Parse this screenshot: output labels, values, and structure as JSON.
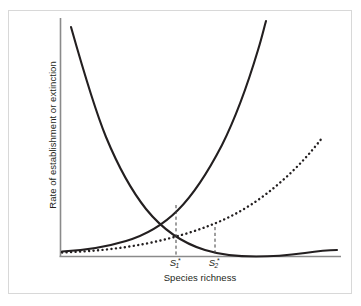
{
  "figure": {
    "background_color": "#ffffff",
    "frame_color": "#d8d8d8",
    "ink_color": "#231f20",
    "axis_color": "#8a8a8a"
  },
  "axes": {
    "y_title": "Rate of establishment or extinction",
    "x_title": "Species richness"
  },
  "ticks": [
    {
      "symbol": "S",
      "sub": "1",
      "sup": "*",
      "x_px": 176
    },
    {
      "symbol": "S",
      "sub": "2",
      "sup": "*",
      "x_px": 215
    }
  ],
  "chart_data": {
    "type": "line",
    "title": "",
    "subtitle": "",
    "xlabel": "Species richness",
    "ylabel": "Rate of establishment or extinction",
    "xlim": [
      0,
      1
    ],
    "ylim": [
      0,
      1
    ],
    "grid": false,
    "legend": "none",
    "x_tick_labels": [
      "S₁*",
      "S₂*"
    ],
    "y_tick_labels": [],
    "annotations": [
      {
        "name": "equilibrium-1",
        "label": "S₁*",
        "description": "Intersection of the decreasing extinction-like curve with the steep increasing establishment curve",
        "x": 0.414,
        "y": 0.218
      },
      {
        "name": "equilibrium-2",
        "label": "S₂*",
        "description": "Intersection of the decreasing extinction-like curve with the shallow dotted establishment curve",
        "x": 0.554,
        "y": 0.126
      }
    ],
    "series": [
      {
        "name": "Rate of extinction (decreasing)",
        "style": "solid",
        "color": "#231f20",
        "width": 2.0,
        "x": [
          0.04,
          0.08,
          0.12,
          0.16,
          0.2,
          0.24,
          0.28,
          0.32,
          0.36,
          0.4,
          0.44,
          0.48,
          0.52,
          0.56,
          0.6,
          0.65,
          0.7,
          0.75,
          0.8,
          0.85,
          0.9,
          0.95,
          1.0
        ],
        "y": [
          0.96,
          0.82,
          0.705,
          0.61,
          0.53,
          0.462,
          0.404,
          0.354,
          0.311,
          0.274,
          0.242,
          0.214,
          0.19,
          0.169,
          0.15,
          0.129,
          0.112,
          0.097,
          0.085,
          0.074,
          0.065,
          0.057,
          0.05
        ]
      },
      {
        "name": "Rate of establishment, high immigration (increasing)",
        "style": "solid",
        "color": "#231f20",
        "width": 2.0,
        "x": [
          0.0,
          0.05,
          0.1,
          0.15,
          0.2,
          0.25,
          0.3,
          0.35,
          0.4,
          0.45,
          0.5,
          0.55,
          0.6,
          0.65,
          0.7,
          0.73
        ],
        "y": [
          0.018,
          0.024,
          0.033,
          0.045,
          0.062,
          0.085,
          0.116,
          0.159,
          0.208,
          0.272,
          0.355,
          0.463,
          0.59,
          0.74,
          0.92,
          1.0
        ]
      },
      {
        "name": "Rate of establishment, low immigration (increasing, dotted)",
        "style": "dotted",
        "color": "#231f20",
        "width": 2.0,
        "x": [
          0.0,
          0.06,
          0.12,
          0.18,
          0.24,
          0.3,
          0.36,
          0.42,
          0.48,
          0.54,
          0.6,
          0.66,
          0.72,
          0.78,
          0.84,
          0.9,
          0.945
        ],
        "y": [
          0.01,
          0.016,
          0.024,
          0.034,
          0.046,
          0.06,
          0.077,
          0.096,
          0.118,
          0.145,
          0.18,
          0.224,
          0.276,
          0.338,
          0.408,
          0.47,
          0.505
        ]
      }
    ],
    "drop_lines": [
      {
        "name": "drop-line-s1",
        "x": 0.414,
        "y_top": 0.218,
        "y_bottom": 0.0,
        "style": "dashed"
      },
      {
        "name": "drop-line-s2",
        "x": 0.554,
        "y_top": 0.126,
        "y_bottom": 0.0,
        "style": "dashed"
      }
    ]
  }
}
